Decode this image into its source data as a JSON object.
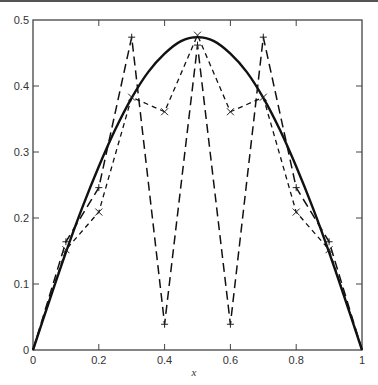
{
  "chart_data": {
    "type": "line",
    "title": "",
    "xlabel": "x",
    "ylabel": "",
    "xlim": [
      0,
      1
    ],
    "ylim": [
      0,
      0.5
    ],
    "grid": false,
    "legend": null,
    "x_ticks": [
      0,
      0.2,
      0.4,
      0.6,
      0.8,
      1
    ],
    "x_tick_labels": [
      "0",
      "0.2",
      "0.4",
      "0.6",
      "0.8",
      "1"
    ],
    "y_ticks": [
      0,
      0.1,
      0.2,
      0.3,
      0.4,
      0.5
    ],
    "y_tick_labels": [
      "0",
      "0.1",
      "0.2",
      "0.3",
      "0.4",
      "0.5"
    ],
    "series": [
      {
        "name": "exact solution",
        "style": "solid",
        "marker": "none",
        "x": [
          0,
          0.05,
          0.1,
          0.15,
          0.2,
          0.25,
          0.3,
          0.35,
          0.4,
          0.45,
          0.5,
          0.55,
          0.6,
          0.65,
          0.7,
          0.75,
          0.8,
          0.85,
          0.9,
          0.95,
          1
        ],
        "values": [
          0,
          0.075,
          0.148,
          0.216,
          0.278,
          0.334,
          0.382,
          0.421,
          0.449,
          0.468,
          0.474,
          0.468,
          0.449,
          0.421,
          0.382,
          0.334,
          0.278,
          0.216,
          0.148,
          0.075,
          0
        ]
      },
      {
        "name": "approximation (+)",
        "style": "long-dash",
        "marker": "+",
        "x": [
          0,
          0.1,
          0.2,
          0.3,
          0.4,
          0.5,
          0.6,
          0.7,
          0.8,
          0.9,
          1
        ],
        "values": [
          0,
          0.164,
          0.246,
          0.474,
          0.039,
          0.462,
          0.039,
          0.474,
          0.246,
          0.164,
          0
        ]
      },
      {
        "name": "approximation (x)",
        "style": "short-dash",
        "marker": "x",
        "x": [
          0,
          0.1,
          0.2,
          0.3,
          0.4,
          0.5,
          0.6,
          0.7,
          0.8,
          0.9,
          1
        ],
        "values": [
          0,
          0.152,
          0.209,
          0.383,
          0.361,
          0.477,
          0.361,
          0.383,
          0.209,
          0.152,
          0
        ]
      }
    ]
  }
}
